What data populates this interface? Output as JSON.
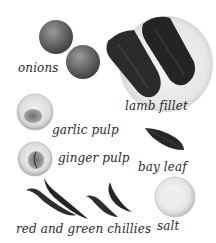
{
  "ingredients": [
    {
      "id": "onions",
      "label": "onions"
    },
    {
      "id": "lamb",
      "label": "lamb fillet"
    },
    {
      "id": "garlic",
      "label": "garlic pulp"
    },
    {
      "id": "ginger",
      "label": "ginger pulp"
    },
    {
      "id": "bayleaf",
      "label": "bay leaf"
    },
    {
      "id": "chillies",
      "label": "red and green chillies"
    },
    {
      "id": "salt",
      "label": "salt"
    }
  ],
  "colors": {
    "background": "#ffffff",
    "label_text": "#2a2a2a",
    "onion": "#6a6a6a",
    "lamb": "#2b2b2b",
    "plate": "#e8e8e8",
    "bowl": "#d9d9d9",
    "leaf": "#262626",
    "chilli": "#2e2e2e"
  }
}
